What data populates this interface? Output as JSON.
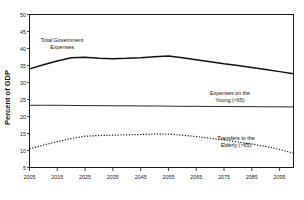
{
  "top_note": "",
  "chart_data": {
    "type": "line",
    "title": "",
    "xlabel": "",
    "ylabel": "Percent of GDP",
    "xlim": [
      2005,
      2100
    ],
    "ylim": [
      5,
      50
    ],
    "ytick_step": 5,
    "grid": false,
    "legend_position": "annotations-inline",
    "xtick_labels": [
      "2005",
      "2015",
      "2025",
      "2035",
      "2045",
      "2055",
      "2065",
      "2075",
      "2085",
      "2095"
    ],
    "xtick_values": [
      2005,
      2015,
      2025,
      2035,
      2045,
      2055,
      2065,
      2075,
      2085,
      2095
    ],
    "ytick_labels": [
      "5",
      "10",
      "15",
      "20",
      "25",
      "30",
      "35",
      "40",
      "45",
      "50"
    ],
    "ytick_values": [
      5,
      10,
      15,
      20,
      25,
      30,
      35,
      40,
      45,
      50
    ],
    "x": [
      2005,
      2010,
      2015,
      2020,
      2025,
      2030,
      2035,
      2040,
      2045,
      2050,
      2055,
      2060,
      2065,
      2070,
      2075,
      2080,
      2085,
      2090,
      2095,
      2100
    ],
    "series": [
      {
        "name": "Total Government Expenses",
        "style": "solid-thick",
        "values": [
          34.0,
          35.2,
          36.3,
          37.3,
          37.4,
          37.1,
          37.0,
          37.1,
          37.3,
          37.6,
          37.8,
          37.3,
          36.7,
          36.1,
          35.5,
          35.0,
          34.4,
          33.8,
          33.2,
          32.6
        ]
      },
      {
        "name": "Expenses on the Young (<65)",
        "style": "solid-thin",
        "values": [
          23.3,
          23.3,
          23.3,
          23.25,
          23.2,
          23.2,
          23.15,
          23.15,
          23.1,
          23.1,
          23.05,
          23.0,
          23.0,
          22.95,
          22.95,
          22.9,
          22.9,
          22.85,
          22.85,
          22.8
        ]
      },
      {
        "name": "Transfers to the Elderly (>65)",
        "style": "dotted",
        "values": [
          10.5,
          11.6,
          12.6,
          13.5,
          14.2,
          14.4,
          14.5,
          14.6,
          14.7,
          14.8,
          14.8,
          14.5,
          14.1,
          13.6,
          13.1,
          12.5,
          11.9,
          11.2,
          10.3,
          9.2
        ]
      }
    ],
    "annotations": [
      {
        "name": "total-government-expenses",
        "lines": [
          "Total Government",
          "Expenses"
        ],
        "x_px": 62,
        "y_px": 42
      },
      {
        "name": "expenses-on-the-young",
        "lines": [
          "Expenses on the",
          "Young (<65)"
        ],
        "x_px": 230,
        "y_px": 95
      },
      {
        "name": "transfers-to-the-elderly",
        "lines": [
          "Transfers to the",
          "Elderly (>65)"
        ],
        "x_px": 236,
        "y_px": 140
      }
    ]
  }
}
